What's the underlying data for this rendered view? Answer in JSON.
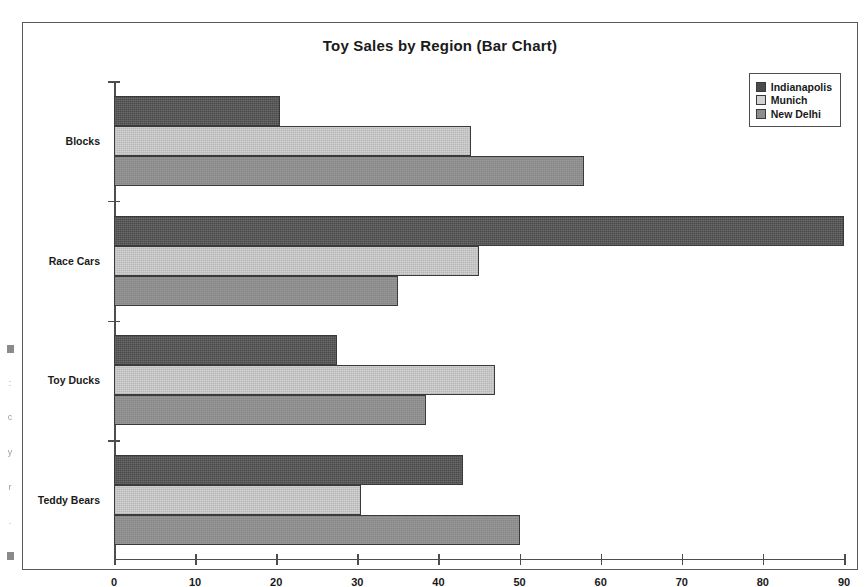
{
  "chart_data": {
    "type": "bar",
    "orientation": "horizontal",
    "title": "Toy Sales by Region (Bar Chart)",
    "xlabel": "",
    "ylabel": "",
    "categories": [
      "Blocks",
      "Race Cars",
      "Toy Ducks",
      "Teddy Bears"
    ],
    "series": [
      {
        "name": "Indianapolis",
        "color": "#4a4a4a",
        "values": [
          20.5,
          90,
          27.5,
          43
        ]
      },
      {
        "name": "Munich",
        "color": "#d2d2d2",
        "values": [
          44,
          45,
          47,
          30.5
        ]
      },
      {
        "name": "New Delhi",
        "color": "#8d8d8d",
        "values": [
          58,
          35,
          38.5,
          50
        ]
      }
    ],
    "xlim": [
      0,
      90
    ],
    "xticks": [
      0,
      10,
      20,
      30,
      40,
      50,
      60,
      70,
      80,
      90
    ],
    "xtick_labels": [
      "0",
      "10",
      "20",
      "30",
      "40",
      "50",
      "60",
      "70",
      "80",
      "90"
    ],
    "grid": false,
    "legend_position": "top-right",
    "frame": true
  },
  "legend": {
    "entries": [
      {
        "label": "Indianapolis"
      },
      {
        "label": "Munich"
      },
      {
        "label": "New Delhi"
      }
    ]
  },
  "margin_artifacts": [
    "■",
    ":",
    "c",
    "y",
    "r",
    ".",
    "■"
  ]
}
